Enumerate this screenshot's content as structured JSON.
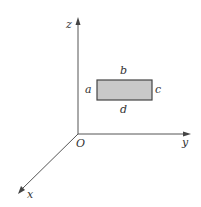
{
  "diagram": {
    "type": "3d-coordinate-axes-with-rectangle",
    "axes": {
      "origin_label": "O",
      "x_label": "x",
      "y_label": "y",
      "z_label": "z"
    },
    "rectangle": {
      "fill_color": "#c8c8c8",
      "stroke_color": "#444444",
      "edge_labels": {
        "left": "a",
        "top": "b",
        "right": "c",
        "bottom": "d"
      }
    },
    "colors": {
      "axis": "#555555",
      "background": "#ffffff"
    }
  }
}
